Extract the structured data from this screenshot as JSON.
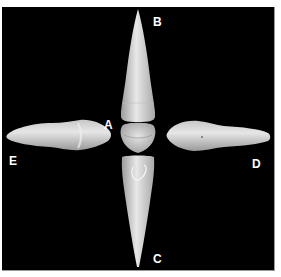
{
  "figure": {
    "background_color": "#000000",
    "border_color": "#ffffff",
    "tooth_color": "#d9d9d9",
    "labels": {
      "a": "A",
      "b": "B",
      "c": "C",
      "d": "D",
      "e": "E"
    },
    "views": [
      {
        "id": "A",
        "description": "central incisal view of tooth"
      },
      {
        "id": "B",
        "description": "tooth pointing up, crown at bottom"
      },
      {
        "id": "C",
        "description": "tooth pointing down, crown at top"
      },
      {
        "id": "D",
        "description": "tooth lying horizontally, pointing right"
      },
      {
        "id": "E",
        "description": "tooth lying horizontally, pointing left"
      }
    ]
  }
}
